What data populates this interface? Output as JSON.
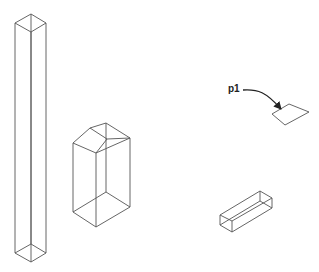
{
  "diagram": {
    "title": "",
    "background": "#ffffff",
    "line_color": "#555555",
    "annotations": [
      {
        "id": "p1",
        "text": "p1",
        "x": 228,
        "y": 84
      }
    ],
    "objects": [
      {
        "name": "tall-square-prism",
        "type": "wireframe-box"
      },
      {
        "name": "gabled-prism",
        "type": "wireframe-box-with-chamfered-top"
      },
      {
        "name": "flat-quad-p1",
        "type": "planar-quadrilateral"
      },
      {
        "name": "small-long-box",
        "type": "wireframe-box"
      }
    ]
  }
}
